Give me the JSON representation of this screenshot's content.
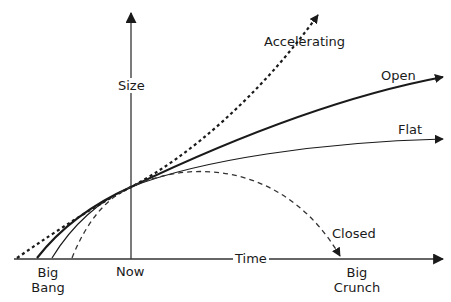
{
  "diagram": {
    "axes": {
      "x_label": "Time",
      "y_label": "Size"
    },
    "markers": {
      "big_bang": [
        "Big",
        "Bang"
      ],
      "now": "Now",
      "big_crunch": [
        "Big",
        "Crunch"
      ]
    },
    "curves": [
      {
        "name": "Accelerating",
        "style": "dotted-thick"
      },
      {
        "name": "Open",
        "style": "solid-thick"
      },
      {
        "name": "Flat",
        "style": "solid-thin"
      },
      {
        "name": "Closed",
        "style": "dashed-thin"
      }
    ],
    "colors": {
      "line": "#1a1a1a",
      "axis": "#333333",
      "background": "#ffffff"
    }
  }
}
